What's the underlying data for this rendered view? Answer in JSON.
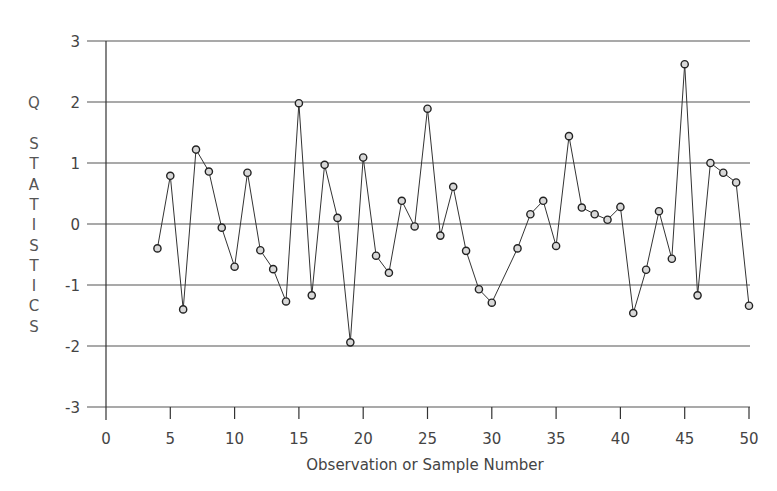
{
  "chart_data": {
    "type": "line",
    "title": "",
    "xlabel": "Observation or Sample Number",
    "ylabel": "Q STATISTICS",
    "xlim": [
      0,
      50
    ],
    "ylim": [
      -3,
      3
    ],
    "x_ticks": [
      0,
      5,
      10,
      15,
      20,
      25,
      30,
      35,
      40,
      45,
      50
    ],
    "y_ticks": [
      3,
      2,
      1,
      0,
      -1,
      -2,
      -3
    ],
    "grid": "horizontal",
    "legend": null,
    "marker": "open-circle",
    "series": [
      {
        "name": "Q statistic",
        "x": [
          4,
          5,
          6,
          7,
          8,
          9,
          10,
          11,
          12,
          13,
          14,
          15,
          16,
          17,
          18,
          19,
          20,
          21,
          22,
          23,
          24,
          25,
          26,
          27,
          28,
          29,
          30,
          32,
          33,
          34,
          35,
          36,
          37,
          38,
          39,
          40,
          41,
          42,
          43,
          44,
          45,
          46,
          47,
          48,
          49,
          50
        ],
        "values": [
          -0.4,
          0.79,
          -1.4,
          1.22,
          0.86,
          -0.06,
          -0.7,
          0.84,
          -0.43,
          -0.74,
          -1.27,
          1.98,
          -1.17,
          0.97,
          0.1,
          -1.94,
          1.09,
          -0.52,
          -0.8,
          0.38,
          -0.04,
          1.89,
          -0.19,
          0.61,
          -0.44,
          -1.07,
          -1.29,
          -0.4,
          0.16,
          0.38,
          -0.36,
          1.44,
          0.27,
          0.16,
          0.07,
          0.28,
          -1.46,
          -0.75,
          0.21,
          -0.57,
          2.62,
          -1.17,
          1.0,
          0.84,
          0.68,
          -1.34
        ]
      }
    ]
  },
  "colors": {
    "line": "#333333",
    "grid": "#555555",
    "marker_fill": "#d8d8d8",
    "marker_stroke": "#222222",
    "text": "#444444"
  }
}
